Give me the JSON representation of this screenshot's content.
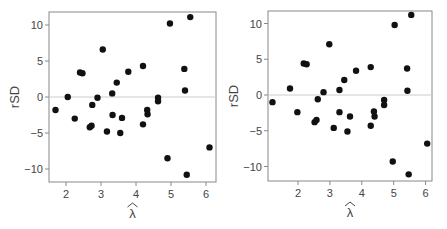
{
  "chart_data": [
    {
      "type": "scatter",
      "title": "",
      "xlabel": "λ̂",
      "ylabel": "rSD",
      "xlim": [
        1.5,
        6.3
      ],
      "ylim": [
        -12,
        12
      ],
      "xticks": [
        2,
        3,
        4,
        5,
        6
      ],
      "yticks": [
        -10,
        -5,
        0,
        5,
        10
      ],
      "reference_line_y": 0,
      "grid": false,
      "points": [
        {
          "x": 1.7,
          "y": -1.8
        },
        {
          "x": 2.05,
          "y": 0.0
        },
        {
          "x": 2.25,
          "y": -3.0
        },
        {
          "x": 2.4,
          "y": 3.4
        },
        {
          "x": 2.47,
          "y": 3.3
        },
        {
          "x": 2.68,
          "y": -4.2
        },
        {
          "x": 2.73,
          "y": -4.0
        },
        {
          "x": 2.75,
          "y": -1.1
        },
        {
          "x": 2.9,
          "y": -0.1
        },
        {
          "x": 3.05,
          "y": 6.6
        },
        {
          "x": 3.17,
          "y": -4.8
        },
        {
          "x": 3.32,
          "y": 0.5
        },
        {
          "x": 3.33,
          "y": -2.5
        },
        {
          "x": 3.45,
          "y": 2.0
        },
        {
          "x": 3.55,
          "y": -5.0
        },
        {
          "x": 3.6,
          "y": -2.9
        },
        {
          "x": 3.78,
          "y": 3.5
        },
        {
          "x": 4.2,
          "y": 4.3
        },
        {
          "x": 4.2,
          "y": -3.8
        },
        {
          "x": 4.32,
          "y": -1.8
        },
        {
          "x": 4.33,
          "y": -2.4
        },
        {
          "x": 4.63,
          "y": -0.1
        },
        {
          "x": 4.63,
          "y": -0.6
        },
        {
          "x": 4.9,
          "y": -8.5
        },
        {
          "x": 4.97,
          "y": 10.2
        },
        {
          "x": 5.38,
          "y": 3.9
        },
        {
          "x": 5.4,
          "y": 0.9
        },
        {
          "x": 5.45,
          "y": -10.8
        },
        {
          "x": 5.55,
          "y": 11.1
        },
        {
          "x": 6.1,
          "y": -7.0
        }
      ]
    },
    {
      "type": "scatter",
      "title": "",
      "xlabel": "λ̂",
      "ylabel": "rSD",
      "xlim": [
        1.1,
        6.2
      ],
      "ylim": [
        -12,
        12
      ],
      "xticks": [
        2,
        3,
        4,
        5,
        6
      ],
      "yticks": [
        -10,
        -5,
        0,
        5,
        10
      ],
      "reference_line_y": 0,
      "grid": false,
      "points": [
        {
          "x": 1.2,
          "y": -1.0
        },
        {
          "x": 1.75,
          "y": 0.9
        },
        {
          "x": 1.98,
          "y": -2.4
        },
        {
          "x": 2.18,
          "y": 4.4
        },
        {
          "x": 2.27,
          "y": 4.3
        },
        {
          "x": 2.52,
          "y": -3.8
        },
        {
          "x": 2.58,
          "y": -3.5
        },
        {
          "x": 2.62,
          "y": -0.6
        },
        {
          "x": 2.8,
          "y": 0.4
        },
        {
          "x": 2.98,
          "y": 7.1
        },
        {
          "x": 3.12,
          "y": -4.6
        },
        {
          "x": 3.3,
          "y": 0.7
        },
        {
          "x": 3.3,
          "y": -2.4
        },
        {
          "x": 3.45,
          "y": 2.1
        },
        {
          "x": 3.55,
          "y": -5.1
        },
        {
          "x": 3.63,
          "y": -3.0
        },
        {
          "x": 3.82,
          "y": 3.4
        },
        {
          "x": 4.28,
          "y": 3.9
        },
        {
          "x": 4.28,
          "y": -4.3
        },
        {
          "x": 4.38,
          "y": -2.3
        },
        {
          "x": 4.4,
          "y": -3.0
        },
        {
          "x": 4.7,
          "y": -0.7
        },
        {
          "x": 4.7,
          "y": -1.4
        },
        {
          "x": 4.97,
          "y": -9.3
        },
        {
          "x": 5.03,
          "y": 9.8
        },
        {
          "x": 5.42,
          "y": 3.7
        },
        {
          "x": 5.43,
          "y": 0.6
        },
        {
          "x": 5.47,
          "y": -11.1
        },
        {
          "x": 5.55,
          "y": 11.2
        },
        {
          "x": 6.05,
          "y": -6.8
        }
      ]
    }
  ],
  "panels": [
    {
      "ylabel": "rSD",
      "xlabel_symbol": "λ",
      "xlabel_accent": "^",
      "ytick_labels": [
        "10",
        "5",
        "0",
        "−5",
        "−10"
      ],
      "xtick_labels": [
        "2",
        "3",
        "4",
        "5",
        "6"
      ]
    },
    {
      "ylabel": "rSD",
      "xlabel_symbol": "λ",
      "xlabel_accent": "^",
      "ytick_labels": [
        "10",
        "5",
        "0",
        "−5",
        "−10"
      ],
      "xtick_labels": [
        "2",
        "3",
        "4",
        "5",
        "6"
      ]
    }
  ],
  "colors": {
    "point": "#111111",
    "axis": "#888888",
    "refline": "#cccccc",
    "text": "#444444"
  }
}
